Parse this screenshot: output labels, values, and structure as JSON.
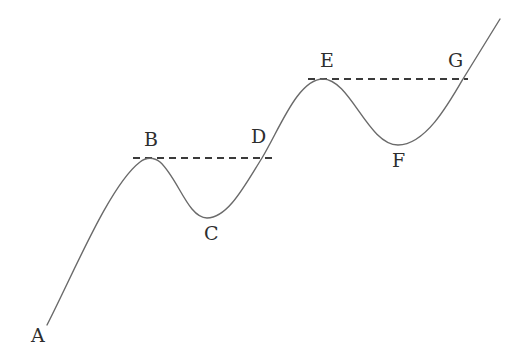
{
  "diagram": {
    "type": "price-wave",
    "colors": {
      "curve": "#6a6a6a",
      "dashed": "#3a3a3a",
      "label": "#2e2e2e",
      "background": "#ffffff"
    },
    "points": [
      {
        "id": "A",
        "label": "A",
        "role": "start"
      },
      {
        "id": "B",
        "label": "B",
        "role": "peak"
      },
      {
        "id": "C",
        "label": "C",
        "role": "trough"
      },
      {
        "id": "D",
        "label": "D",
        "role": "crossing"
      },
      {
        "id": "E",
        "label": "E",
        "role": "peak"
      },
      {
        "id": "F",
        "label": "F",
        "role": "trough"
      },
      {
        "id": "G",
        "label": "G",
        "role": "crossing"
      }
    ],
    "dashed_lines": [
      {
        "from": "B",
        "to": "D",
        "level": "B peak"
      },
      {
        "from": "E",
        "to": "G",
        "level": "E peak"
      }
    ]
  }
}
